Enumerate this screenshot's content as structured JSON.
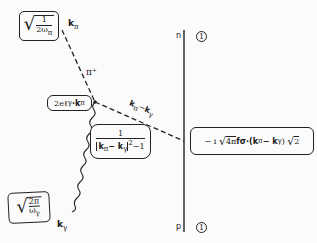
{
  "diagram": {
    "type": "feynman-diagram",
    "top_factor": {
      "sqrt_numerator": "1",
      "sqrt_denominator": "2ω",
      "sub": "π"
    },
    "pion_momentum_label": {
      "main": "k",
      "sub": "π"
    },
    "pion_label": "π⁺",
    "vertex_factor": "2eℓ",
    "vertex_factor_sub": "γ",
    "vertex_factor_rest": "·k",
    "vertex_factor_sub2": "π",
    "propagator_momentum": {
      "a": "k",
      "a_sub": "π",
      "minus": "−",
      "b": "k",
      "b_sub": "γ"
    },
    "propagator_factor": {
      "numerator": "1",
      "denominator_left": "k",
      "sub1": "π",
      "minus": "− k",
      "sub2": "γ",
      "power": "2",
      "tail": "−1"
    },
    "nucleon_vertex_factor": {
      "prefix": "− i",
      "sqrt_arg": "4π",
      "rest": "fσ·(k",
      "sub1": "π",
      "minus": "− k",
      "sub2": "γ",
      "close": ")",
      "sqrt2": "2"
    },
    "nucleon_top": {
      "label": "n",
      "factor": "1"
    },
    "nucleon_bottom": {
      "label": "p",
      "factor": "1"
    },
    "photon_factor": {
      "sqrt_numerator": "2π",
      "sqrt_denominator": "ω",
      "sub": "γ"
    },
    "photon_momentum_label": {
      "main": "k",
      "sub": "γ"
    }
  }
}
